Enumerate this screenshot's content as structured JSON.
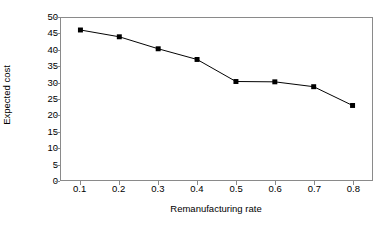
{
  "chart_data": {
    "type": "line",
    "title": "",
    "xlabel": "Remanufacturing rate",
    "ylabel": "Expected cost",
    "x": [
      0.1,
      0.2,
      0.3,
      0.4,
      0.5,
      0.6,
      0.7,
      0.8
    ],
    "values": [
      46.3,
      44.2,
      40.5,
      37.2,
      30.4,
      30.3,
      28.8,
      23.0
    ],
    "xticklabels": [
      "0.1",
      "0.2",
      "0.3",
      "0.4",
      "0.5",
      "0.6",
      "0.7",
      "0.8"
    ],
    "yticklabels": [
      "0",
      "5",
      "10",
      "15",
      "20",
      "25",
      "30",
      "35",
      "40",
      "45",
      "50"
    ],
    "yticks": [
      0,
      5,
      10,
      15,
      20,
      25,
      30,
      35,
      40,
      45,
      50
    ],
    "ylim": [
      0,
      50
    ],
    "xlim": [
      0.05,
      0.85
    ],
    "grid": false,
    "legend": false,
    "marker": "square",
    "line_color": "#000000",
    "marker_color": "#000000",
    "frame_color": "#8a8a8a",
    "background": "#ffffff"
  }
}
